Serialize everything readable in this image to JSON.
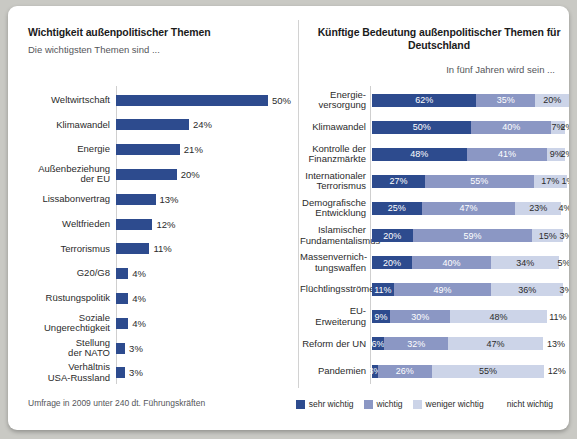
{
  "left": {
    "title": "Wichtigkeit außenpolitischer Themen",
    "subtitle": "Die wichtigsten Themen sind ..."
  },
  "right": {
    "title": "Künftige Bedeutung außenpolitischer Themen für Deutschland",
    "subtitle": "In fünf Jahren wird sein ..."
  },
  "footnote": "Umfrage in 2009 unter 240 dt. Führungskräften",
  "legend": [
    {
      "label": "sehr wichtig",
      "color": "#2d4b8e"
    },
    {
      "label": "wichtig",
      "color": "#8b97c4"
    },
    {
      "label": "weniger wichtig",
      "color": "#ccd4e8"
    },
    {
      "label": "nicht wichtig",
      "color": "#ffffff"
    }
  ],
  "chart_data": [
    {
      "type": "bar",
      "title": "Wichtigkeit außenpolitischer Themen",
      "subtitle": "Die wichtigsten Themen sind ...",
      "orientation": "horizontal",
      "xlabel": "",
      "ylabel": "",
      "xlim": [
        0,
        50
      ],
      "grid": false,
      "legend": "none",
      "color": "#2d4b8e",
      "categories": [
        "Weltwirtschaft",
        "Klimawandel",
        "Energie",
        "Außenbeziehung\nder EU",
        "Lissabonvertrag",
        "Weltfrieden",
        "Terrorismus",
        "G20/G8",
        "Rüstungspolitik",
        "Soziale\nUngerechtigkeit",
        "Stellung\nder NATO",
        "Verhältnis\nUSA-Russland"
      ],
      "values": [
        50,
        24,
        21,
        20,
        13,
        12,
        11,
        4,
        4,
        4,
        3,
        3
      ],
      "value_labels": [
        "50%",
        "24%",
        "21%",
        "20%",
        "13%",
        "12%",
        "11%",
        "4%",
        "4%",
        "4%",
        "3%",
        "3%"
      ]
    },
    {
      "type": "bar",
      "subtype": "stacked-100",
      "title": "Künftige Bedeutung außenpolitischer Themen für Deutschland",
      "subtitle": "In fünf Jahren wird sein ...",
      "orientation": "horizontal",
      "xlabel": "",
      "ylabel": "",
      "xlim": [
        0,
        100
      ],
      "grid": false,
      "legend": "bottom",
      "categories": [
        "Energie-\nversorgung",
        "Klimawandel",
        "Kontrolle der\nFinanzmärkte",
        "Internationaler\nTerrorismus",
        "Demografische\nEntwicklung",
        "Islamischer\nFundamentalismus",
        "Massenvernich-\ntungswaffen",
        "Flüchtlingsströme",
        "EU-Erweiterung",
        "Reform der UN",
        "Pandemien"
      ],
      "series": [
        {
          "name": "sehr wichtig",
          "color": "#2d4b8e",
          "values": [
            62,
            50,
            48,
            27,
            25,
            20,
            20,
            11,
            9,
            6,
            3
          ]
        },
        {
          "name": "wichtig",
          "color": "#8b97c4",
          "values": [
            35,
            40,
            41,
            55,
            47,
            59,
            40,
            49,
            30,
            32,
            26
          ]
        },
        {
          "name": "weniger wichtig",
          "color": "#ccd4e8",
          "values": [
            20,
            7,
            9,
            17,
            23,
            15,
            34,
            36,
            48,
            47,
            55
          ]
        },
        {
          "name": "nicht wichtig",
          "color": "#ffffff",
          "values": [
            0,
            2,
            2,
            1,
            4,
            3,
            5,
            3,
            11,
            13,
            12
          ]
        }
      ],
      "rows": [
        {
          "label": "Energie-\nversorgung",
          "segments": [
            {
              "v": 62,
              "t": "62%"
            },
            {
              "v": 35,
              "t": "35%"
            },
            {
              "v": 20,
              "t": "20%"
            },
            {
              "v": 0,
              "t": ""
            }
          ]
        },
        {
          "label": "Klimawandel",
          "segments": [
            {
              "v": 50,
              "t": "50%"
            },
            {
              "v": 40,
              "t": "40%"
            },
            {
              "v": 7,
              "t": "7%"
            },
            {
              "v": 2,
              "t": "2%"
            }
          ]
        },
        {
          "label": "Kontrolle der\nFinanzmärkte",
          "segments": [
            {
              "v": 48,
              "t": "48%"
            },
            {
              "v": 41,
              "t": "41%"
            },
            {
              "v": 9,
              "t": "9%"
            },
            {
              "v": 2,
              "t": "2%"
            }
          ]
        },
        {
          "label": "Internationaler\nTerrorismus",
          "segments": [
            {
              "v": 27,
              "t": "27%"
            },
            {
              "v": 55,
              "t": "55%"
            },
            {
              "v": 17,
              "t": "17%"
            },
            {
              "v": 1,
              "t": "1%"
            }
          ]
        },
        {
          "label": "Demografische\nEntwicklung",
          "segments": [
            {
              "v": 25,
              "t": "25%"
            },
            {
              "v": 47,
              "t": "47%"
            },
            {
              "v": 23,
              "t": "23%"
            },
            {
              "v": 4,
              "t": "4%"
            }
          ]
        },
        {
          "label": "Islamischer\nFundamentalismus",
          "segments": [
            {
              "v": 20,
              "t": "20%"
            },
            {
              "v": 59,
              "t": "59%"
            },
            {
              "v": 15,
              "t": "15%"
            },
            {
              "v": 3,
              "t": "3%"
            }
          ]
        },
        {
          "label": "Massenvernich-\ntungswaffen",
          "segments": [
            {
              "v": 20,
              "t": "20%"
            },
            {
              "v": 40,
              "t": "40%"
            },
            {
              "v": 34,
              "t": "34%"
            },
            {
              "v": 5,
              "t": "5%"
            }
          ]
        },
        {
          "label": "Flüchtlingsströme",
          "segments": [
            {
              "v": 11,
              "t": "11%"
            },
            {
              "v": 49,
              "t": "49%"
            },
            {
              "v": 36,
              "t": "36%"
            },
            {
              "v": 3,
              "t": "3%"
            }
          ]
        },
        {
          "label": "EU-Erweiterung",
          "segments": [
            {
              "v": 9,
              "t": "9%"
            },
            {
              "v": 30,
              "t": "30%"
            },
            {
              "v": 48,
              "t": "48%"
            },
            {
              "v": 11,
              "t": "11%"
            }
          ]
        },
        {
          "label": "Reform der UN",
          "segments": [
            {
              "v": 6,
              "t": "6%"
            },
            {
              "v": 32,
              "t": "32%"
            },
            {
              "v": 47,
              "t": "47%"
            },
            {
              "v": 13,
              "t": "13%"
            }
          ]
        },
        {
          "label": "Pandemien",
          "segments": [
            {
              "v": 3,
              "t": "3%"
            },
            {
              "v": 26,
              "t": "26%"
            },
            {
              "v": 55,
              "t": "55%"
            },
            {
              "v": 12,
              "t": "12%"
            }
          ]
        }
      ]
    }
  ]
}
